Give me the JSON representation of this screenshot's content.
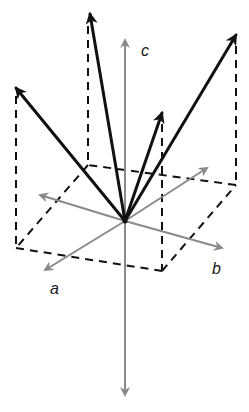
{
  "figure": {
    "type": "3d-vector-diagram",
    "colors": {
      "axis": "#8a8a8a",
      "vector": "#111111",
      "dashed": "#111111",
      "background": "#ffffff"
    },
    "origin": [
      125,
      221
    ],
    "axes": [
      {
        "name": "a",
        "label": "a",
        "pos_tip": [
          45,
          270
        ],
        "neg_tip": [
          40,
          195
        ],
        "label_pos": [
          52,
          294
        ]
      },
      {
        "name": "b",
        "label": "b",
        "pos_tip": [
          222,
          248
        ],
        "neg_tip": [
          207,
          168
        ],
        "label_pos": [
          213,
          272
        ]
      },
      {
        "name": "c",
        "label": "c",
        "pos_tip": [
          125,
          40
        ],
        "neg_tip": [
          125,
          395
        ],
        "label_pos": [
          142,
          55
        ]
      }
    ],
    "vectors": [
      {
        "id": "v1",
        "tip": [
          16,
          88
        ],
        "base": [
          16,
          248
        ]
      },
      {
        "id": "v2",
        "tip": [
          90,
          14
        ],
        "base": [
          88,
          165
        ]
      },
      {
        "id": "v3",
        "tip": [
          162,
          113
        ],
        "base": [
          162,
          271
        ]
      },
      {
        "id": "v4",
        "tip": [
          236,
          35
        ],
        "base": [
          236,
          185
        ]
      }
    ],
    "dashed_box": [
      [
        16,
        248
      ],
      [
        162,
        271
      ],
      [
        236,
        185
      ],
      [
        88,
        165
      ]
    ]
  }
}
